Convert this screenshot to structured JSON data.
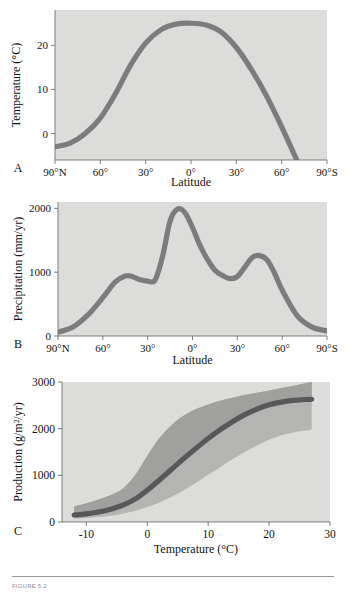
{
  "figure": {
    "caption": "FIGURE 5.2",
    "panels": [
      "A",
      "B",
      "C"
    ]
  },
  "chart_data": [
    {
      "id": "panel-a",
      "panel_letter": "A",
      "type": "line",
      "title": "",
      "xlabel": "Latitude",
      "ylabel": "Temperature (°C)",
      "xticklabels": [
        "90°N",
        "60°",
        "30°",
        "0°",
        "30°",
        "60°",
        "90°S"
      ],
      "xticks": [
        90,
        60,
        30,
        0,
        -30,
        -60,
        -90
      ],
      "xlim": [
        90,
        -90
      ],
      "yticks": [
        0,
        10,
        20
      ],
      "yticklabels": [
        "0",
        "10",
        "20"
      ],
      "ylim": [
        -6,
        28
      ],
      "grid": false,
      "legend": null,
      "series": [
        {
          "name": "Mean annual temperature",
          "color": "#7c7c7c",
          "x": [
            90,
            80,
            70,
            60,
            50,
            40,
            30,
            20,
            10,
            0,
            -10,
            -20,
            -30,
            -40,
            -50,
            -60,
            -70
          ],
          "values": [
            -3.0,
            -2.2,
            0.0,
            3.5,
            9.0,
            15.5,
            20.5,
            23.5,
            24.8,
            25.0,
            24.6,
            23.0,
            19.5,
            14.5,
            8.5,
            1.5,
            -6.0
          ]
        }
      ]
    },
    {
      "id": "panel-b",
      "panel_letter": "B",
      "type": "line",
      "title": "",
      "xlabel": "Latitude",
      "ylabel": "Precipitation (mm/yr)",
      "xticklabels": [
        "90°N",
        "60°",
        "30°",
        "0°",
        "30°",
        "60°",
        "90°S"
      ],
      "xticks": [
        90,
        60,
        30,
        0,
        -30,
        -60,
        -90
      ],
      "xlim": [
        90,
        -90
      ],
      "yticks": [
        0,
        1000,
        2000
      ],
      "yticklabels": [
        "0",
        "1000",
        "2000"
      ],
      "ylim": [
        0,
        2100
      ],
      "grid": false,
      "legend": null,
      "series": [
        {
          "name": "Mean annual precipitation",
          "color": "#7c7c7c",
          "x": [
            90,
            80,
            70,
            60,
            52,
            45,
            40,
            35,
            30,
            25,
            20,
            15,
            10,
            5,
            0,
            -5,
            -10,
            -15,
            -20,
            -25,
            -30,
            -35,
            -40,
            -45,
            -50,
            -55,
            -60,
            -70,
            -80,
            -90
          ],
          "values": [
            60,
            140,
            330,
            600,
            840,
            940,
            930,
            880,
            860,
            880,
            1250,
            1800,
            1990,
            1930,
            1700,
            1420,
            1200,
            1030,
            950,
            900,
            930,
            1080,
            1230,
            1260,
            1190,
            980,
            720,
            320,
            140,
            80
          ]
        }
      ]
    },
    {
      "id": "panel-c",
      "panel_letter": "C",
      "type": "area",
      "title": "",
      "xlabel": "Temperature (°C)",
      "ylabel": "Production (g/m²/yr)",
      "xticklabels": [
        "-10",
        "0",
        "10",
        "20",
        "30"
      ],
      "xticks": [
        -10,
        0,
        10,
        20,
        30
      ],
      "xlim": [
        -14,
        30
      ],
      "yticks": [
        0,
        1000,
        2000,
        3000
      ],
      "yticklabels": [
        "0",
        "1000",
        "2000",
        "3000"
      ],
      "ylim": [
        0,
        3000
      ],
      "grid": false,
      "legend": null,
      "series": [
        {
          "name": "Upper envelope (maximum production)",
          "color": "#b4b4b2",
          "x": [
            -12,
            -10,
            -8,
            -6,
            -4,
            -2,
            0,
            2,
            4,
            6,
            8,
            10,
            12,
            14,
            16,
            18,
            20,
            22,
            24,
            26,
            27
          ],
          "values": [
            330,
            400,
            480,
            580,
            720,
            1000,
            1420,
            1800,
            2080,
            2280,
            2420,
            2520,
            2600,
            2660,
            2720,
            2770,
            2820,
            2870,
            2920,
            2975,
            3000
          ]
        },
        {
          "name": "Lower envelope (minimum production)",
          "color": "#b4b4b2",
          "x": [
            -12,
            -10,
            -8,
            -6,
            -4,
            -2,
            0,
            2,
            4,
            6,
            8,
            10,
            12,
            14,
            16,
            18,
            20,
            22,
            24,
            26,
            27
          ],
          "values": [
            70,
            85,
            105,
            135,
            180,
            240,
            320,
            420,
            540,
            680,
            840,
            1010,
            1180,
            1350,
            1500,
            1640,
            1760,
            1860,
            1920,
            1960,
            1975
          ]
        },
        {
          "name": "Mean production",
          "color": "#585858",
          "x": [
            -12,
            -10,
            -8,
            -6,
            -4,
            -2,
            0,
            2,
            4,
            6,
            8,
            10,
            12,
            14,
            16,
            18,
            20,
            22,
            24,
            26,
            27
          ],
          "values": [
            150,
            175,
            215,
            275,
            360,
            490,
            680,
            900,
            1130,
            1360,
            1580,
            1790,
            1980,
            2150,
            2300,
            2420,
            2510,
            2570,
            2605,
            2625,
            2630
          ]
        }
      ]
    }
  ]
}
